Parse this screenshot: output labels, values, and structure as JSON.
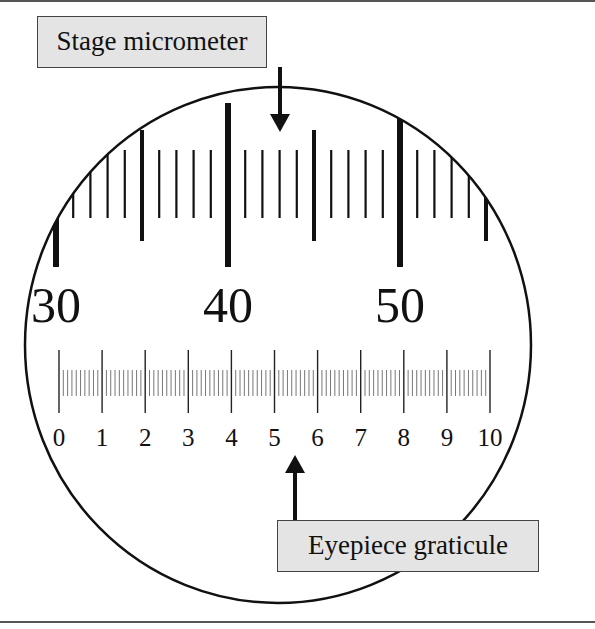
{
  "labels": {
    "stage": "Stage micrometer",
    "eyepiece": "Eyepiece graticule"
  },
  "colors": {
    "ink": "#111111",
    "label_fill": "#e4e4e4",
    "border": "#555555"
  },
  "field_of_view": {
    "cx": 278,
    "cy": 345,
    "rx": 253,
    "ry": 258
  },
  "stage_micrometer": {
    "start": 30,
    "end": 56,
    "x_at_start": 56,
    "px_per_unit": 17.2,
    "number_labels": [
      {
        "value": 30,
        "text": "30"
      },
      {
        "value": 40,
        "text": "40"
      },
      {
        "value": 50,
        "text": "50"
      }
    ]
  },
  "eyepiece_graticule": {
    "x0": 59,
    "x10": 490,
    "subdivisions": 10,
    "number_labels": [
      "0",
      "1",
      "2",
      "3",
      "4",
      "5",
      "6",
      "7",
      "8",
      "9",
      "10"
    ]
  },
  "arrows": {
    "stage": {
      "x": 280,
      "y1": 67,
      "y2": 132,
      "direction": "down"
    },
    "eyepiece": {
      "x": 295,
      "y1": 520,
      "y2": 455,
      "direction": "up"
    }
  }
}
